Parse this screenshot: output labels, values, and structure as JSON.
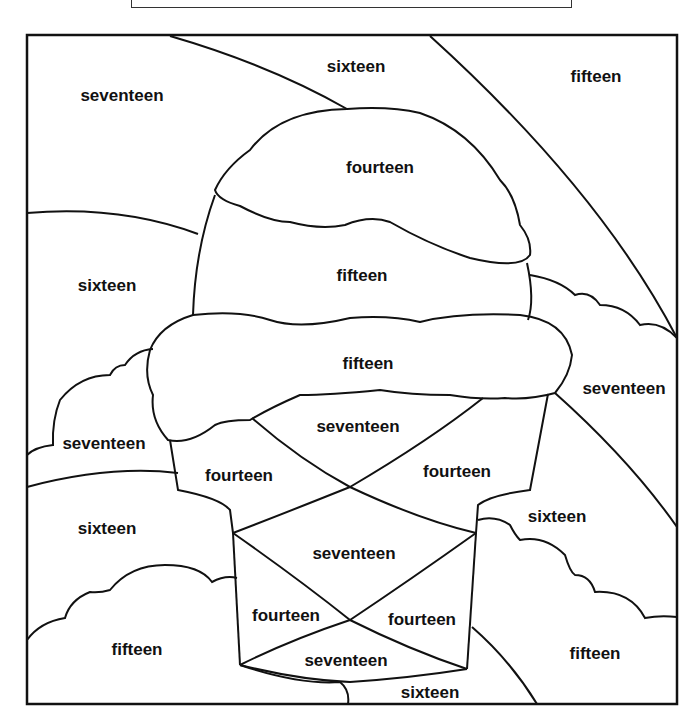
{
  "worksheet": {
    "title_box": "",
    "picture": "ice cream cone color-by-number",
    "labels": [
      {
        "text": "sixteen",
        "x": 356,
        "y": 67
      },
      {
        "text": "fifteen",
        "x": 596,
        "y": 77
      },
      {
        "text": "seventeen",
        "x": 122,
        "y": 96
      },
      {
        "text": "fourteen",
        "x": 380,
        "y": 168
      },
      {
        "text": "fifteen",
        "x": 362,
        "y": 276
      },
      {
        "text": "sixteen",
        "x": 107,
        "y": 286
      },
      {
        "text": "fifteen",
        "x": 368,
        "y": 364
      },
      {
        "text": "seventeen",
        "x": 624,
        "y": 389
      },
      {
        "text": "seventeen",
        "x": 358,
        "y": 427
      },
      {
        "text": "seventeen",
        "x": 104,
        "y": 444
      },
      {
        "text": "fourteen",
        "x": 239,
        "y": 476
      },
      {
        "text": "fourteen",
        "x": 457,
        "y": 472
      },
      {
        "text": "sixteen",
        "x": 557,
        "y": 517
      },
      {
        "text": "sixteen",
        "x": 107,
        "y": 529
      },
      {
        "text": "seventeen",
        "x": 354,
        "y": 554
      },
      {
        "text": "fourteen",
        "x": 286,
        "y": 616
      },
      {
        "text": "fourteen",
        "x": 422,
        "y": 620
      },
      {
        "text": "fifteen",
        "x": 137,
        "y": 650
      },
      {
        "text": "fifteen",
        "x": 595,
        "y": 654
      },
      {
        "text": "seventeen",
        "x": 346,
        "y": 661
      },
      {
        "text": "sixteen",
        "x": 430,
        "y": 693
      }
    ]
  }
}
